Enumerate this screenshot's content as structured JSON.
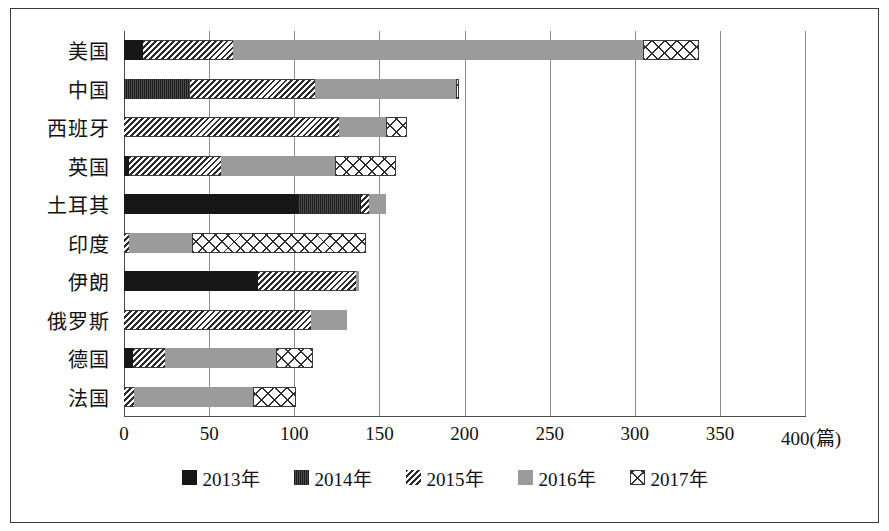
{
  "chart_data": {
    "type": "bar",
    "orientation": "horizontal",
    "stacked": true,
    "title": "",
    "xlabel": "(篇)",
    "ylabel": "",
    "xlim": [
      0,
      400
    ],
    "xticks": [
      0,
      50,
      100,
      150,
      200,
      250,
      300,
      350,
      400
    ],
    "xtick_labels": [
      "0",
      "50",
      "100",
      "150",
      "200",
      "250",
      "300",
      "350",
      "400(篇)"
    ],
    "grid": true,
    "grid_axis": "x",
    "legend_position": "bottom",
    "categories": [
      "美国",
      "中国",
      "西班牙",
      "英国",
      "土耳其",
      "印度",
      "伊朗",
      "俄罗斯",
      "德国",
      "法国"
    ],
    "series": [
      {
        "name": "2013年",
        "pattern": "solid-black",
        "color": "#171717",
        "values": [
          11,
          0,
          0,
          3,
          102,
          0,
          79,
          0,
          5,
          0
        ]
      },
      {
        "name": "2014年",
        "pattern": "dense-dark",
        "color": "#333333",
        "values": [
          0,
          39,
          0,
          0,
          37,
          0,
          0,
          0,
          0,
          0
        ]
      },
      {
        "name": "2015年",
        "pattern": "diagonal-hatch",
        "color": "#2b2b2b",
        "values": [
          53,
          73,
          126,
          54,
          5,
          3,
          57,
          110,
          19,
          6
        ]
      },
      {
        "name": "2016年",
        "pattern": "solid-gray",
        "color": "#9b9b9b",
        "values": [
          241,
          83,
          28,
          67,
          10,
          37,
          2,
          21,
          65,
          70
        ]
      },
      {
        "name": "2017年",
        "pattern": "crosshatch",
        "color": "#ffffff",
        "values": [
          33,
          2,
          12,
          36,
          0,
          102,
          0,
          0,
          22,
          25
        ]
      }
    ],
    "totals": [
      338,
      197,
      166,
      160,
      154,
      142,
      138,
      131,
      111,
      101
    ]
  },
  "legend": {
    "items": [
      {
        "label": "2013年",
        "series_class": "s2013"
      },
      {
        "label": "2014年",
        "series_class": "s2014"
      },
      {
        "label": "2015年",
        "series_class": "s2015"
      },
      {
        "label": "2016年",
        "series_class": "s2016"
      },
      {
        "label": "2017年",
        "series_class": "s2017"
      }
    ]
  }
}
